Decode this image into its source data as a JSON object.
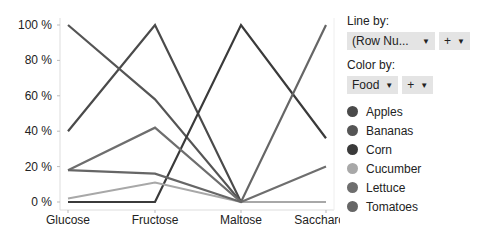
{
  "chart_data": {
    "type": "line",
    "title": "",
    "xlabel": "",
    "ylabel": "",
    "categories": [
      "Glucose",
      "Fructose",
      "Maltose",
      "Saccharose"
    ],
    "yticks": [
      "0 %",
      "20 %",
      "40 %",
      "60 %",
      "80 %",
      "100 %"
    ],
    "ylim": [
      0,
      100
    ],
    "grid": false,
    "legend_position": "right",
    "series": [
      {
        "name": "Apples",
        "color": "#4a4a4a",
        "values": [
          40,
          100,
          0,
          0
        ]
      },
      {
        "name": "Bananas",
        "color": "#555555",
        "values": [
          100,
          58,
          0,
          0
        ]
      },
      {
        "name": "Corn",
        "color": "#3a3a3a",
        "values": [
          0,
          0,
          100,
          36
        ]
      },
      {
        "name": "Cucumber",
        "color": "#a8a8a8",
        "values": [
          2,
          11,
          0,
          0
        ]
      },
      {
        "name": "Lettuce",
        "color": "#6e6e6e",
        "values": [
          18,
          42,
          0,
          20
        ]
      },
      {
        "name": "Tomatoes",
        "color": "#666666",
        "values": [
          18,
          16,
          0,
          100
        ]
      }
    ]
  },
  "controls": {
    "line_by_label": "Line by:",
    "line_by_value": "(Row Nu...",
    "color_by_label": "Color by:",
    "color_by_value": "Food",
    "plus": "+",
    "arrow": "▼"
  }
}
